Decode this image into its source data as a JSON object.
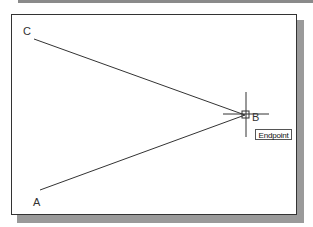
{
  "drawing": {
    "points": [
      {
        "id": "A",
        "label": "A",
        "x": 40,
        "y": 190
      },
      {
        "id": "B",
        "label": "B",
        "x": 245,
        "y": 115
      },
      {
        "id": "C",
        "label": "C",
        "x": 34,
        "y": 39
      }
    ],
    "lines": [
      {
        "from": "C",
        "to": "B"
      },
      {
        "from": "A",
        "to": "B"
      }
    ],
    "cursor": {
      "type": "crosshair",
      "x": 246,
      "y": 115
    },
    "snap": {
      "marker": "endpoint-square",
      "tooltip": "Endpoint"
    }
  },
  "colors": {
    "line": "#333333",
    "shadow": "#9a9a9a",
    "frame": "#333333"
  }
}
